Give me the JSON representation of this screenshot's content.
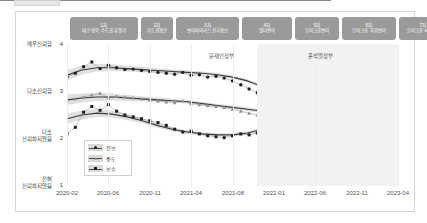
{
  "chart_data": {
    "type": "line",
    "title": "",
    "xlabel": "",
    "ylabel": "",
    "ylim": [
      1,
      4
    ],
    "grid": true,
    "legend_position": "inside-bottom-left",
    "x_tick_labels": [
      "2020-02",
      "2020-06",
      "2020-11",
      "2021-04",
      "2021-08",
      "2022-01",
      "2022-06",
      "2022-11",
      "2023-04"
    ],
    "y_ticks": [
      {
        "value": "4",
        "label": "매우신뢰함"
      },
      {
        "value": "3",
        "label": "다소신뢰함"
      },
      {
        "value": "2",
        "label": "다소\n신뢰하지않음"
      },
      {
        "value": "1",
        "label": "전혀\n신뢰하지않음"
      }
    ],
    "legend": [
      {
        "name": "진보",
        "marker": "circle",
        "color": "#1e1e1e"
      },
      {
        "name": "중도",
        "marker": "triangle",
        "color": "#9a9a9a"
      },
      {
        "name": "보수",
        "marker": "square",
        "color": "#1e1e1e"
      }
    ],
    "series": [
      {
        "name": "진보",
        "marker": "circle",
        "values": [
          3.3,
          3.38,
          3.52,
          3.62,
          3.48,
          3.55,
          3.5,
          3.46,
          3.47,
          3.44,
          3.42,
          3.4,
          3.38,
          3.36,
          3.4,
          3.34,
          3.35,
          3.3,
          3.32,
          3.28,
          3.22,
          3.14,
          3.05,
          2.97,
          3.12,
          2.92,
          2.78,
          2.7,
          2.74,
          2.82,
          2.66,
          2.74,
          2.78,
          2.86,
          2.84,
          2.9,
          2.94,
          2.88,
          2.98,
          3.0,
          3.02
        ],
        "trend": [
          3.34,
          3.45,
          3.5,
          3.5,
          3.48,
          3.46,
          3.44,
          3.42,
          3.4,
          3.38,
          3.35,
          3.3,
          3.22,
          3.1,
          2.96,
          2.84,
          2.76,
          2.72,
          2.74,
          2.8,
          2.88,
          2.96,
          3.02
        ]
      },
      {
        "name": "중도",
        "marker": "triangle",
        "values": [
          2.8,
          2.84,
          2.88,
          2.92,
          2.96,
          2.86,
          2.9,
          2.88,
          2.86,
          2.84,
          2.82,
          2.8,
          2.78,
          2.76,
          2.8,
          2.74,
          2.72,
          2.7,
          2.68,
          2.66,
          2.62,
          2.58,
          2.54,
          2.5,
          2.56,
          2.52,
          2.48,
          2.46,
          2.44,
          2.42,
          2.36,
          2.32,
          2.3,
          2.28,
          2.26,
          2.24,
          2.26,
          2.22,
          2.24,
          2.26,
          2.28
        ],
        "trend": [
          2.82,
          2.86,
          2.88,
          2.88,
          2.86,
          2.84,
          2.82,
          2.8,
          2.78,
          2.74,
          2.7,
          2.66,
          2.62,
          2.58,
          2.54,
          2.5,
          2.46,
          2.42,
          2.38,
          2.34,
          2.3,
          2.28,
          2.26
        ]
      },
      {
        "name": "보수",
        "marker": "square",
        "values": [
          2.1,
          2.24,
          2.56,
          2.68,
          2.6,
          2.72,
          2.58,
          2.5,
          2.46,
          2.42,
          2.38,
          2.34,
          2.28,
          2.2,
          2.14,
          2.16,
          2.1,
          2.06,
          2.04,
          2.02,
          2.06,
          2.1,
          2.08,
          2.12,
          2.16,
          2.24,
          2.34,
          2.46,
          2.54,
          2.62,
          2.7,
          2.76,
          2.78,
          2.84,
          2.88,
          2.92,
          2.96,
          2.94,
          3.0,
          3.02,
          3.04
        ],
        "trend": [
          2.42,
          2.5,
          2.54,
          2.52,
          2.46,
          2.38,
          2.28,
          2.2,
          2.14,
          2.1,
          2.08,
          2.08,
          2.12,
          2.2,
          2.32,
          2.46,
          2.58,
          2.7,
          2.8,
          2.88,
          2.94,
          3.0,
          3.06
        ]
      }
    ],
    "waves": [
      {
        "num": "1차",
        "text": "대구·경북·수도권 유행기"
      },
      {
        "num": "2차",
        "text": "수도권확산"
      },
      {
        "num": "3차",
        "text": "변이바이러스 전국확산"
      },
      {
        "num": "4차",
        "text": "델타변이"
      },
      {
        "num": "5차",
        "text": "오미크론변이"
      },
      {
        "num": "6차",
        "text": "오미크론 하위변이"
      },
      {
        "num": "7차",
        "text": "오미크론 BQ변이"
      }
    ],
    "annotations": [
      {
        "text": "문재인정부"
      },
      {
        "text": "윤석열정부"
      }
    ]
  }
}
